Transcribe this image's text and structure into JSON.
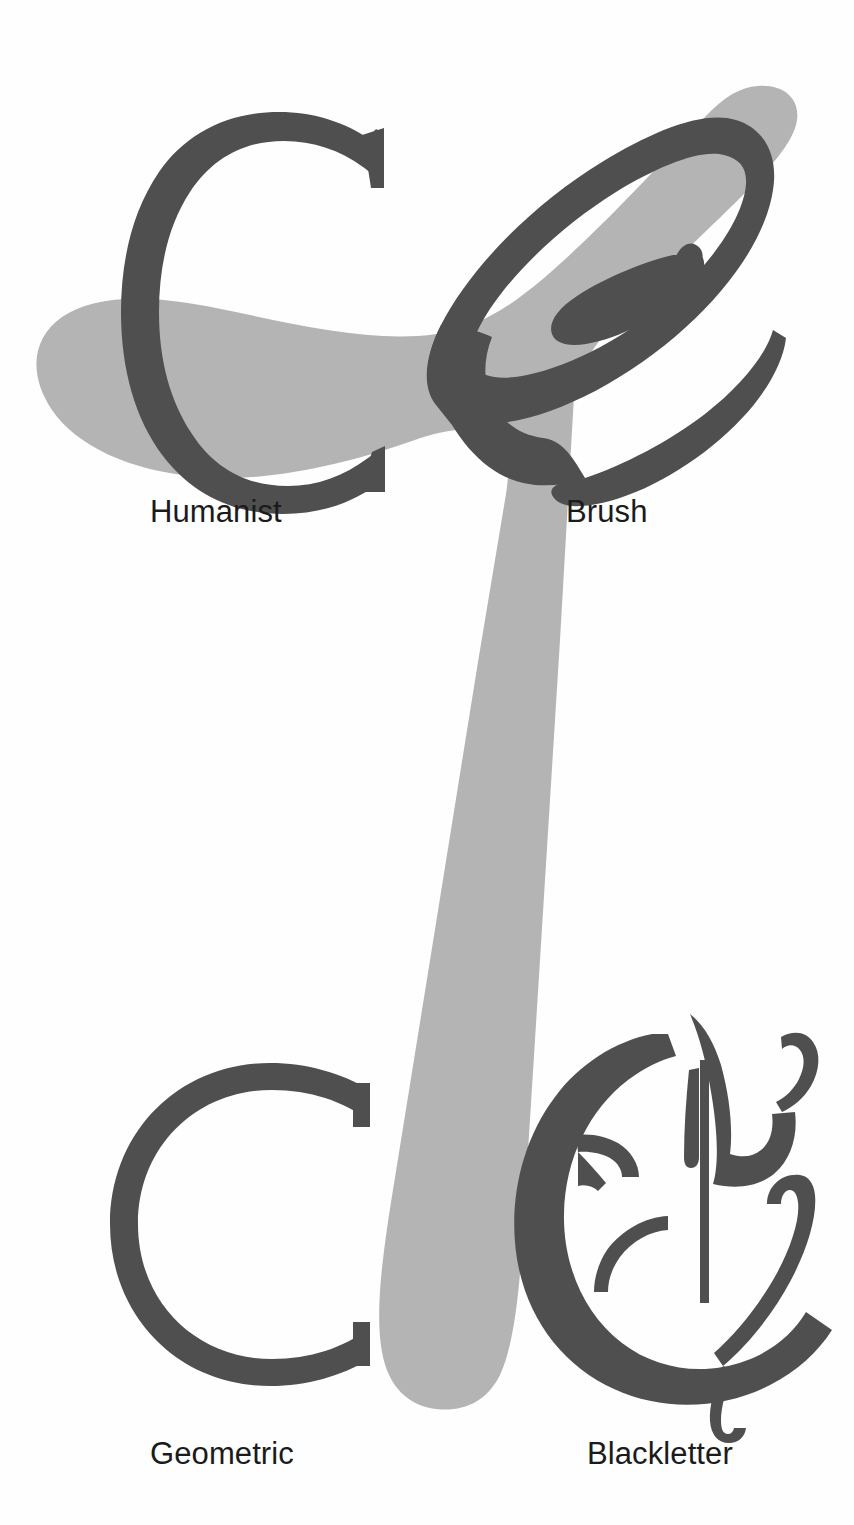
{
  "page": {
    "background_color": "#fefefe",
    "width": 854,
    "height": 1525
  },
  "palette": {
    "glyph_dark": "#4f4f4f",
    "swash_gray": "#b4b4b4",
    "label_text": "#1b1b1b",
    "background": "#fefefe"
  },
  "swash": {
    "name": "decorative-calligraphic-swash",
    "color": "#b4b4b4",
    "description": "Large light-gray calligraphic stroke sweeping from upper right down to lower center"
  },
  "specimens": [
    {
      "id": "humanist",
      "label": "Humanist",
      "letter": "C",
      "glyph_name": "humanist-c-glyph",
      "color": "#4f4f4f",
      "position": "top-left"
    },
    {
      "id": "brush",
      "label": "Brush",
      "letter": "C",
      "glyph_name": "brush-c-glyph",
      "color": "#4f4f4f",
      "position": "top-right"
    },
    {
      "id": "geometric",
      "label": "Geometric",
      "letter": "C",
      "glyph_name": "geometric-c-glyph",
      "color": "#4f4f4f",
      "position": "bottom-left"
    },
    {
      "id": "blackletter",
      "label": "Blackletter",
      "letter": "C",
      "glyph_name": "blackletter-c-glyph",
      "color": "#4f4f4f",
      "position": "bottom-right"
    }
  ]
}
